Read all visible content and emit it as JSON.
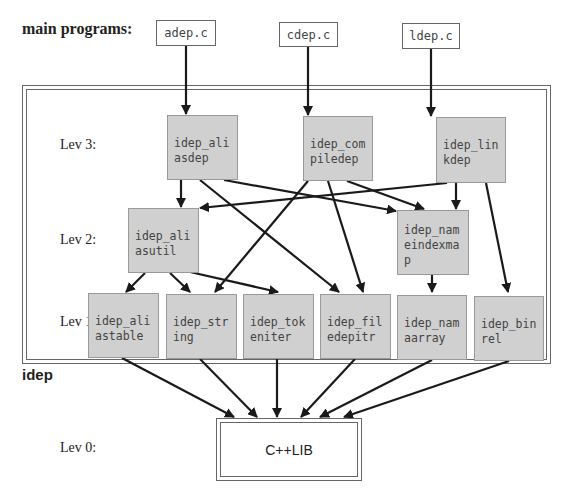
{
  "title": "main programs:",
  "frame_label": "idep",
  "levels": {
    "lev3": "Lev 3:",
    "lev2": "Lev 2:",
    "lev1": "Lev 1:",
    "lev0": "Lev 0:"
  },
  "main_programs": [
    {
      "id": "adep",
      "label": "adep.c"
    },
    {
      "id": "cdep",
      "label": "cdep.c"
    },
    {
      "id": "ldep",
      "label": "ldep.c"
    }
  ],
  "nodes": {
    "aliasdep": {
      "label": "idep_ali\nasdep",
      "level": 3
    },
    "compiledep": {
      "label": "idep_com\npiledep",
      "level": 3
    },
    "linkdep": {
      "label": "idep_lin\nkdep",
      "level": 3
    },
    "aliasutil": {
      "label": "idep_ali\nasutil",
      "level": 2
    },
    "nameindexmap": {
      "label": "idep_nam\neindexma\np",
      "level": 2
    },
    "aliastable": {
      "label": "idep_ali\nastable",
      "level": 1
    },
    "string": {
      "label": "idep_str\ning",
      "level": 1
    },
    "tokeniter": {
      "label": "idep_tok\neniter",
      "level": 1
    },
    "filedepitr": {
      "label": "idep_fil\nedepitr",
      "level": 1
    },
    "namarray": {
      "label": "idep_nam\naarray",
      "level": 1
    },
    "binrel": {
      "label": "idep_bin\nrel",
      "level": 1
    }
  },
  "library": {
    "label": "C++LIB",
    "level": 0
  },
  "edges": [
    [
      "adep.c",
      "idep_aliasdep"
    ],
    [
      "cdep.c",
      "idep_compiledep"
    ],
    [
      "ldep.c",
      "idep_linkdep"
    ],
    [
      "idep_aliasdep",
      "idep_aliasutil"
    ],
    [
      "idep_aliasdep",
      "idep_nameindexmap"
    ],
    [
      "idep_aliasdep",
      "idep_filedepitr"
    ],
    [
      "idep_compiledep",
      "idep_string"
    ],
    [
      "idep_compiledep",
      "idep_filedepitr"
    ],
    [
      "idep_compiledep",
      "idep_nameindexmap"
    ],
    [
      "idep_linkdep",
      "idep_aliasutil"
    ],
    [
      "idep_linkdep",
      "idep_nameindexmap"
    ],
    [
      "idep_linkdep",
      "idep_binrel"
    ],
    [
      "idep_aliasutil",
      "idep_aliastable"
    ],
    [
      "idep_aliasutil",
      "idep_string"
    ],
    [
      "idep_aliasutil",
      "idep_tokeniter"
    ],
    [
      "idep_nameindexmap",
      "idep_namarray"
    ],
    [
      "idep_aliastable",
      "C++LIB"
    ],
    [
      "idep_string",
      "C++LIB"
    ],
    [
      "idep_tokeniter",
      "C++LIB"
    ],
    [
      "idep_filedepitr",
      "C++LIB"
    ],
    [
      "idep_namarray",
      "C++LIB"
    ],
    [
      "idep_binrel",
      "C++LIB"
    ]
  ]
}
